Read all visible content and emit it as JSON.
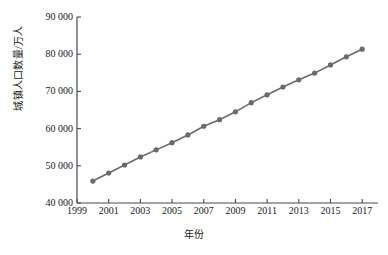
{
  "chart_data": {
    "type": "line",
    "title": "",
    "xlabel": "年份",
    "ylabel": "城镇人口数量/万人",
    "xlim": [
      1999,
      2018
    ],
    "ylim": [
      40000,
      90000
    ],
    "grid": false,
    "legend": null,
    "x_tick_labels": [
      "1999",
      "2001",
      "2003",
      "2005",
      "2007",
      "2009",
      "2011",
      "2013",
      "2015",
      "2017"
    ],
    "x_tick_values": [
      1999,
      2001,
      2003,
      2005,
      2007,
      2009,
      2011,
      2013,
      2015,
      2017
    ],
    "y_tick_labels": [
      "40 000",
      "50 000",
      "60 000",
      "70 000",
      "80 000",
      "90 000"
    ],
    "y_tick_values": [
      40000,
      50000,
      60000,
      70000,
      80000,
      90000
    ],
    "x": [
      2000,
      2001,
      2002,
      2003,
      2004,
      2005,
      2006,
      2007,
      2008,
      2009,
      2010,
      2011,
      2012,
      2013,
      2014,
      2015,
      2016,
      2017
    ],
    "values": [
      45906,
      48064,
      50212,
      52376,
      54283,
      56212,
      58288,
      60633,
      62403,
      64512,
      66978,
      69079,
      71182,
      73111,
      74916,
      77116,
      79298,
      81347
    ],
    "series": [
      {
        "name": "城镇人口数量",
        "values": [
          45906,
          48064,
          50212,
          52376,
          54283,
          56212,
          58288,
          60633,
          62403,
          64512,
          66978,
          69079,
          71182,
          73111,
          74916,
          77116,
          79298,
          81347
        ]
      }
    ],
    "marker": "circle",
    "line_color": "#6b6b6b",
    "marker_color": "#6b6b6b",
    "axis_color": "#4a4a4a"
  },
  "axes": {
    "y_title": "城镇人口数量/万人",
    "x_title": "年份"
  }
}
